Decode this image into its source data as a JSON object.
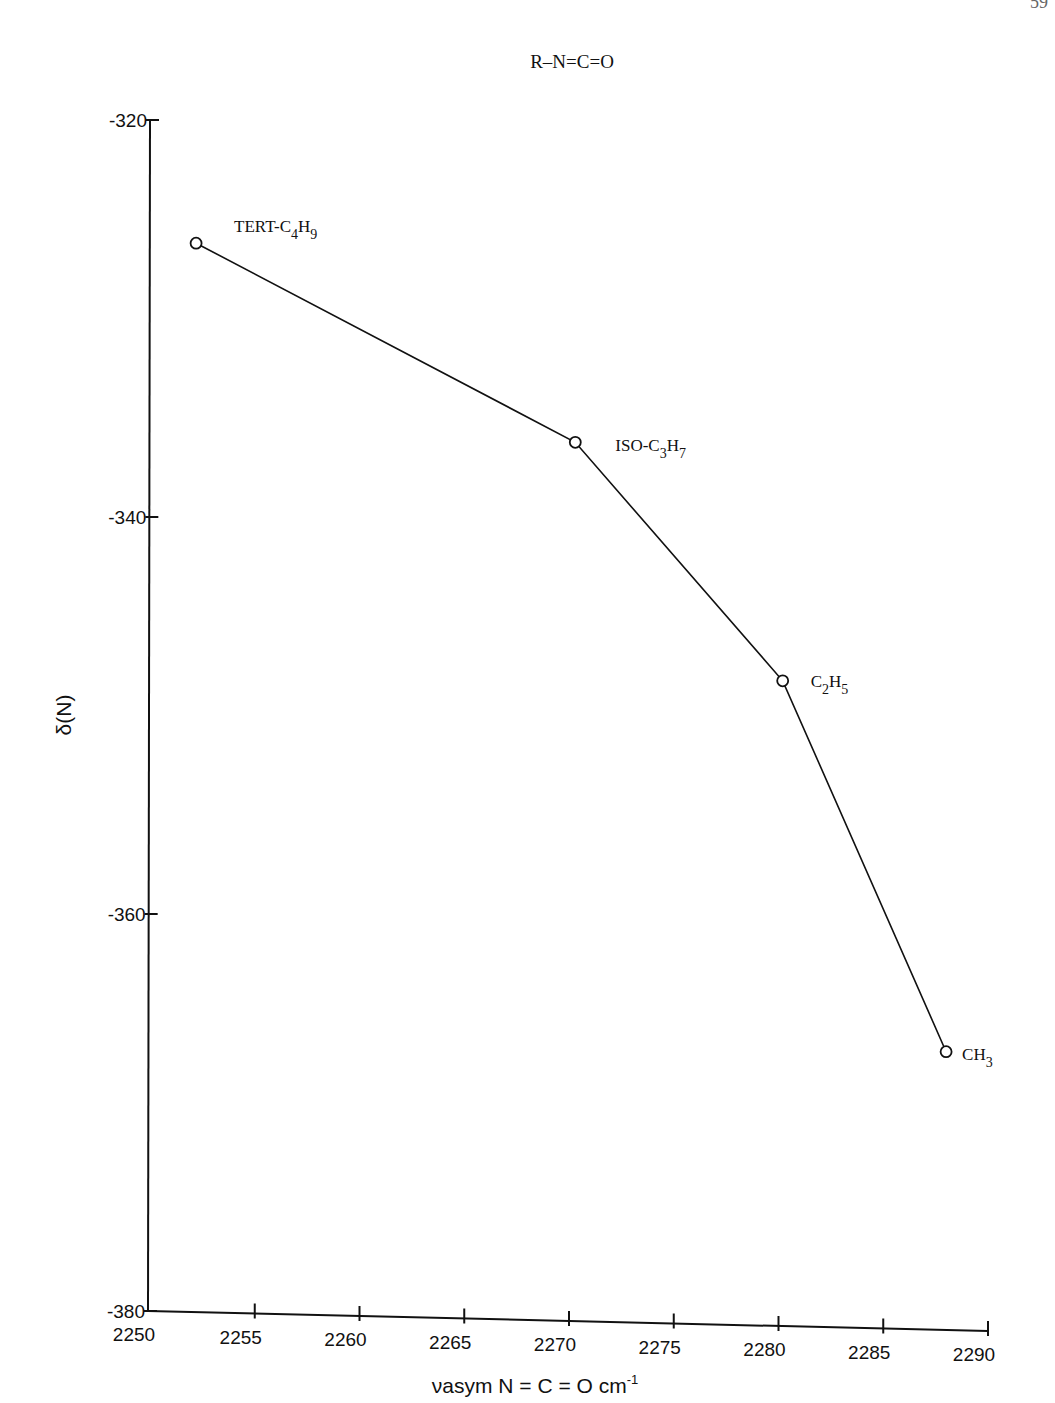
{
  "page": {
    "page_number_fragment": "59"
  },
  "chart_data": {
    "type": "line",
    "title": "R–N=C=O",
    "xlabel": "νasym N = C = O cm⁻¹",
    "ylabel": "δ(N)",
    "xlim": [
      2250,
      2290
    ],
    "ylim": [
      -380,
      -320
    ],
    "x_ticks": [
      2250,
      2255,
      2260,
      2265,
      2270,
      2275,
      2280,
      2285,
      2290
    ],
    "y_ticks": [
      -320,
      -340,
      -360,
      -380
    ],
    "grid": false,
    "legend": null,
    "series": [
      {
        "name": "R–N=C=O",
        "marker": "open-circle",
        "points": [
          {
            "label": "TERT-C4H9",
            "label_main": "TERT-C",
            "sub1": "4",
            "mid": "H",
            "sub2": "9",
            "x": 2252.2,
            "y": -326.2
          },
          {
            "label": "ISO-C3H7",
            "label_main": "ISO-C",
            "sub1": "3",
            "mid": "H",
            "sub2": "7",
            "x": 2270.3,
            "y": -336.1
          },
          {
            "label": "C2H5",
            "label_main": "C",
            "sub1": "2",
            "mid": "H",
            "sub2": "5",
            "x": 2280.2,
            "y": -347.9
          },
          {
            "label": "CH3",
            "label_main": "CH",
            "sub1": "3",
            "mid": "",
            "sub2": "",
            "x": 2288.0,
            "y": -366.2
          }
        ]
      }
    ]
  },
  "axis_text": {
    "x_tick_labels": [
      "2250",
      "2255",
      "2260",
      "2265",
      "2270",
      "2275",
      "2280",
      "2285",
      "2290"
    ],
    "y_tick_labels": [
      "-320",
      "-340",
      "-360",
      "-380"
    ],
    "xlabel_main": "νasym N = C = O cm",
    "xlabel_sup": "-1",
    "ylabel": "δ(N)"
  }
}
